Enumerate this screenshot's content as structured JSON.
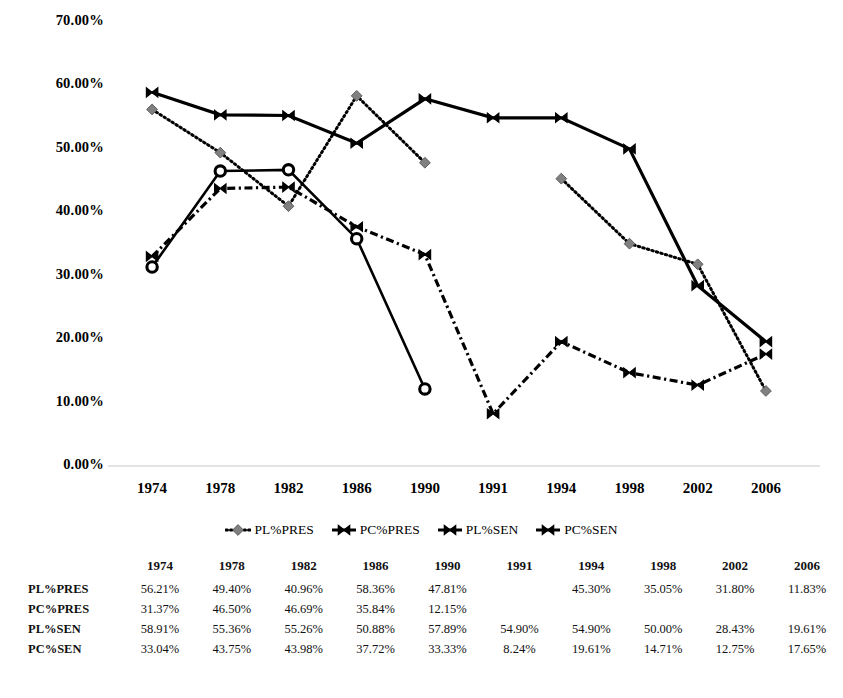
{
  "chart_data": {
    "type": "line",
    "title": "",
    "xlabel": "",
    "ylabel": "",
    "categories": [
      "1974",
      "1978",
      "1982",
      "1986",
      "1990",
      "1991",
      "1994",
      "1998",
      "2002",
      "2006"
    ],
    "ylim": [
      0,
      70
    ],
    "ytick_labels": [
      "0.00%",
      "10.00%",
      "20.00%",
      "30.00%",
      "40.00%",
      "50.00%",
      "60.00%",
      "70.00%"
    ],
    "ytick_values": [
      0,
      10,
      20,
      30,
      40,
      50,
      60,
      70
    ],
    "grid": false,
    "legend_position": "bottom",
    "series": [
      {
        "name": "PL%PRES",
        "marker": "diamond",
        "line_style": "dotted",
        "color": "#000000",
        "marker_color": "#808080",
        "values": [
          56.21,
          49.4,
          40.96,
          58.36,
          47.81,
          null,
          45.3,
          35.05,
          31.8,
          11.83
        ],
        "labels": [
          "56.21%",
          "49.40%",
          "40.96%",
          "58.36%",
          "47.81%",
          "",
          "45.30%",
          "35.05%",
          "31.80%",
          "11.83%"
        ]
      },
      {
        "name": "PC%PRES",
        "marker": "circle",
        "line_style": "solid",
        "color": "#000000",
        "marker_color": "#000000",
        "values": [
          31.37,
          46.5,
          46.69,
          35.84,
          12.15,
          null,
          null,
          null,
          null,
          null
        ],
        "labels": [
          "31.37%",
          "46.50%",
          "46.69%",
          "35.84%",
          "12.15%",
          "",
          "",
          "",
          "",
          ""
        ]
      },
      {
        "name": "PL%SEN",
        "marker": "bowtie",
        "line_style": "solid",
        "color": "#000000",
        "marker_color": "#000000",
        "values": [
          58.91,
          55.36,
          55.26,
          50.88,
          57.89,
          54.9,
          54.9,
          50.0,
          28.43,
          19.61
        ],
        "labels": [
          "58.91%",
          "55.36%",
          "55.26%",
          "50.88%",
          "57.89%",
          "54.90%",
          "54.90%",
          "50.00%",
          "28.43%",
          "19.61%"
        ]
      },
      {
        "name": "PC%SEN",
        "marker": "bowtie",
        "line_style": "dash-dot",
        "color": "#000000",
        "marker_color": "#000000",
        "values": [
          33.04,
          43.75,
          43.98,
          37.72,
          33.33,
          8.24,
          19.61,
          14.71,
          12.75,
          17.65
        ],
        "labels": [
          "33.04%",
          "43.75%",
          "43.98%",
          "37.72%",
          "33.33%",
          "8.24%",
          "19.61%",
          "14.71%",
          "12.75%",
          "17.65%"
        ]
      }
    ]
  },
  "legend": {
    "items": [
      {
        "label": "PL%PRES",
        "key": "dotted-diamond"
      },
      {
        "label": "PC%PRES",
        "key": "solid-circle"
      },
      {
        "label": "PL%SEN",
        "key": "dashed-bowtie"
      },
      {
        "label": "PC%SEN",
        "key": "dashdot-bowtie"
      }
    ]
  },
  "table": {
    "corner": "",
    "columns": [
      "1974",
      "1978",
      "1982",
      "1986",
      "1990",
      "1991",
      "1994",
      "1998",
      "2002",
      "2006"
    ],
    "rows": [
      {
        "label": "PL%PRES",
        "cells": [
          "56.21%",
          "49.40%",
          "40.96%",
          "58.36%",
          "47.81%",
          "",
          "45.30%",
          "35.05%",
          "31.80%",
          "11.83%"
        ]
      },
      {
        "label": "PC%PRES",
        "cells": [
          "31.37%",
          "46.50%",
          "46.69%",
          "35.84%",
          "12.15%",
          "",
          "",
          "",
          "",
          ""
        ]
      },
      {
        "label": "PL%SEN",
        "cells": [
          "58.91%",
          "55.36%",
          "55.26%",
          "50.88%",
          "57.89%",
          "54.90%",
          "54.90%",
          "50.00%",
          "28.43%",
          "19.61%"
        ]
      },
      {
        "label": "PC%SEN",
        "cells": [
          "33.04%",
          "43.75%",
          "43.98%",
          "37.72%",
          "33.33%",
          "8.24%",
          "19.61%",
          "14.71%",
          "12.75%",
          "17.65%"
        ]
      }
    ]
  }
}
